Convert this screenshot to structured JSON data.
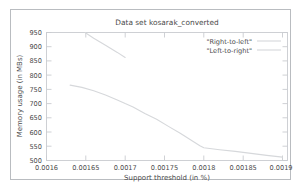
{
  "figure": {
    "background_color": "#ffffff",
    "frame_color": "#b9bcc0",
    "axis_color": "#c9ccd0",
    "text_color": "#4a4a4a"
  },
  "chart_data": {
    "type": "line",
    "title": "Data set kosarak_converted",
    "xlabel": "Support threshold (in %)",
    "ylabel": "Memory usage (in MBs)",
    "xlim": [
      0.0016,
      0.0019
    ],
    "ylim": [
      500,
      950
    ],
    "xticks": [
      0.0016,
      0.00165,
      0.0017,
      0.00175,
      0.0018,
      0.00185,
      0.0019
    ],
    "xtick_labels": [
      "0.0016",
      "0.00165",
      "0.0017",
      "0.00175",
      "0.0018",
      "0.00185",
      "0.0019"
    ],
    "yticks": [
      500,
      550,
      600,
      650,
      700,
      750,
      800,
      850,
      900,
      950
    ],
    "ytick_labels": [
      "500",
      "550",
      "600",
      "650",
      "700",
      "750",
      "800",
      "850",
      "900",
      "950"
    ],
    "grid": false,
    "legend_position": "top-right",
    "series": [
      {
        "name": "\"Right-to-left\"",
        "color": "#d6d8db",
        "x": [
          0.001649,
          0.00166,
          0.001675,
          0.00169,
          0.0017
        ],
        "y": [
          950,
          930,
          905,
          880,
          862
        ]
      },
      {
        "name": "\"Left-to-right\"",
        "color": "#d6d8db",
        "x": [
          0.00163,
          0.001645,
          0.00166,
          0.001675,
          0.00169,
          0.0017,
          0.00171,
          0.001725,
          0.00174,
          0.001755,
          0.00177,
          0.00178,
          0.001795,
          0.0018,
          0.00182,
          0.00184,
          0.00186,
          0.00188,
          0.0019
        ],
        "y": [
          765,
          757,
          745,
          730,
          713,
          700,
          688,
          665,
          645,
          620,
          596,
          578,
          552,
          545,
          538,
          532,
          525,
          518,
          512
        ]
      }
    ]
  },
  "legend": {
    "entries": [
      {
        "label": "\"Right-to-left\""
      },
      {
        "label": "\"Left-to-right\""
      }
    ]
  }
}
